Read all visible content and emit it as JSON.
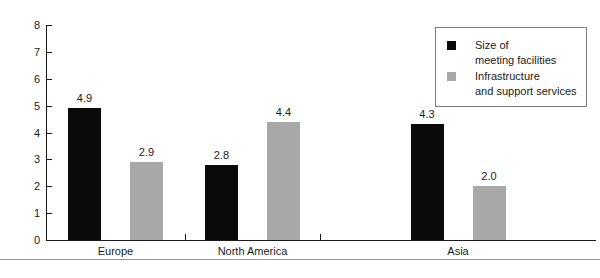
{
  "chart_data": {
    "type": "bar",
    "title": "",
    "subtitle": "",
    "xlabel": "",
    "ylabel": "",
    "categories": [
      "Europe",
      "North America",
      "Asia"
    ],
    "series": [
      {
        "name": "Size of\nmeeting facilities",
        "color": "#0a0a0a",
        "values": [
          4.9,
          2.8,
          4.3
        ]
      },
      {
        "name": "Infrastructure\nand support services",
        "color": "#a8a8a8",
        "values": [
          2.9,
          4.4,
          2.0
        ]
      }
    ],
    "ylim": [
      0,
      8
    ],
    "yticks": [
      "0",
      "1",
      "2",
      "3",
      "4",
      "5",
      "6",
      "7",
      "8"
    ],
    "grid": false,
    "legend_position": "top-right",
    "data_labels": [
      "4.9",
      "2.9",
      "2.8",
      "4.4",
      "4.3",
      "2.0"
    ]
  },
  "legend": {
    "entries": [
      {
        "label": "Size of\nmeeting facilities",
        "swatch": "#0a0a0a"
      },
      {
        "label": "Infrastructure\nand support services",
        "swatch": "#a8a8a8"
      }
    ]
  }
}
